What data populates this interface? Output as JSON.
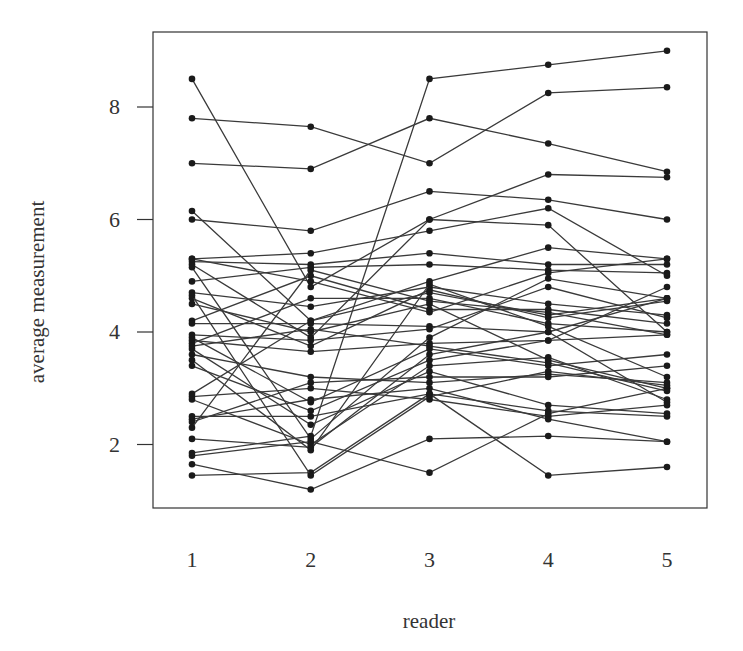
{
  "chart_data": {
    "type": "line",
    "title": "",
    "xlabel": "reader",
    "ylabel": "average measurement",
    "categories": [
      "1",
      "2",
      "3",
      "4",
      "5"
    ],
    "x": [
      1,
      2,
      3,
      4,
      5
    ],
    "yticks": [
      2,
      4,
      6,
      8
    ],
    "ylim": [
      1.0,
      9.3
    ],
    "xlim": [
      0.7,
      5.35
    ],
    "grid": false,
    "legend": "none",
    "x_ticks_drawn": false,
    "line_color": "#3a3a3a",
    "point_color": "#1a1a1a",
    "series": [
      {
        "name": "s1",
        "values": [
          8.5,
          4.8,
          6.0,
          5.9,
          4.0
        ]
      },
      {
        "name": "s2",
        "values": [
          7.8,
          7.65,
          7.0,
          8.25,
          8.35
        ]
      },
      {
        "name": "s3",
        "values": [
          7.0,
          6.9,
          7.8,
          7.35,
          6.85
        ]
      },
      {
        "name": "s4",
        "values": [
          6.15,
          4.2,
          4.9,
          5.5,
          5.3
        ]
      },
      {
        "name": "s5",
        "values": [
          6.0,
          5.8,
          6.5,
          6.35,
          6.0
        ]
      },
      {
        "name": "s6",
        "values": [
          5.3,
          5.4,
          5.8,
          6.2,
          5.0
        ]
      },
      {
        "name": "s7",
        "values": [
          5.25,
          5.2,
          5.4,
          5.2,
          5.2
        ]
      },
      {
        "name": "s8",
        "values": [
          5.2,
          3.9,
          6.0,
          6.8,
          6.75
        ]
      },
      {
        "name": "s9",
        "values": [
          5.15,
          2.1,
          3.9,
          4.95,
          4.6
        ]
      },
      {
        "name": "s10",
        "values": [
          4.9,
          5.15,
          5.2,
          5.1,
          5.05
        ]
      },
      {
        "name": "s11",
        "values": [
          4.7,
          4.45,
          4.8,
          4.5,
          4.3
        ]
      },
      {
        "name": "s12",
        "values": [
          4.6,
          3.75,
          4.75,
          4.25,
          4.55
        ]
      },
      {
        "name": "s13",
        "values": [
          4.5,
          4.0,
          4.5,
          3.5,
          3.0
        ]
      },
      {
        "name": "s14",
        "values": [
          4.2,
          5.0,
          4.4,
          4.4,
          4.15
        ]
      },
      {
        "name": "s15",
        "values": [
          4.15,
          4.15,
          4.1,
          4.0,
          4.6
        ]
      },
      {
        "name": "s16",
        "values": [
          3.9,
          2.75,
          3.7,
          3.4,
          3.6
        ]
      },
      {
        "name": "s17",
        "values": [
          3.85,
          3.65,
          3.8,
          3.85,
          3.95
        ]
      },
      {
        "name": "s18",
        "values": [
          3.8,
          4.6,
          4.6,
          4.15,
          4.0
        ]
      },
      {
        "name": "s19",
        "values": [
          3.7,
          2.35,
          3.3,
          2.7,
          2.55
        ]
      },
      {
        "name": "s20",
        "values": [
          3.6,
          3.2,
          3.1,
          3.25,
          3.1
        ]
      },
      {
        "name": "s21",
        "values": [
          3.5,
          1.9,
          4.85,
          4.1,
          3.2
        ]
      },
      {
        "name": "s22",
        "values": [
          3.4,
          2.6,
          3.5,
          3.85,
          4.8
        ]
      },
      {
        "name": "s23",
        "values": [
          2.9,
          4.2,
          4.7,
          4.3,
          4.6
        ]
      },
      {
        "name": "s24",
        "values": [
          2.85,
          3.0,
          2.8,
          2.5,
          2.7
        ]
      },
      {
        "name": "s25",
        "values": [
          2.8,
          2.0,
          3.4,
          3.55,
          2.8
        ]
      },
      {
        "name": "s26",
        "values": [
          2.5,
          2.5,
          2.9,
          2.6,
          2.5
        ]
      },
      {
        "name": "s27",
        "values": [
          2.4,
          3.1,
          3.2,
          3.2,
          3.4
        ]
      },
      {
        "name": "s28",
        "values": [
          2.3,
          5.1,
          4.55,
          4.35,
          3.95
        ]
      },
      {
        "name": "s29",
        "values": [
          2.1,
          1.95,
          3.6,
          4.0,
          2.75
        ]
      },
      {
        "name": "s30",
        "values": [
          1.85,
          2.15,
          8.5,
          8.75,
          9.0
        ]
      },
      {
        "name": "s31",
        "values": [
          1.8,
          2.05,
          1.5,
          2.55,
          3.0
        ]
      },
      {
        "name": "s32",
        "values": [
          1.65,
          1.2,
          2.1,
          2.15,
          2.05
        ]
      },
      {
        "name": "s33",
        "values": [
          1.45,
          1.5,
          2.9,
          1.45,
          1.6
        ]
      },
      {
        "name": "s34",
        "values": [
          5.3,
          4.9,
          4.35,
          5.05,
          5.3
        ]
      },
      {
        "name": "s35",
        "values": [
          3.75,
          4.05,
          3.75,
          3.45,
          2.95
        ]
      },
      {
        "name": "s36",
        "values": [
          2.45,
          2.8,
          3.0,
          2.45,
          2.05
        ]
      },
      {
        "name": "s37",
        "values": [
          4.65,
          1.45,
          2.85,
          3.3,
          3.05
        ]
      },
      {
        "name": "s38",
        "values": [
          3.95,
          3.85,
          4.05,
          4.8,
          4.25
        ]
      }
    ]
  },
  "axes": {
    "xlabel": "reader",
    "ylabel": "average measurement",
    "xtick_labels": [
      "1",
      "2",
      "3",
      "4",
      "5"
    ],
    "ytick_labels": [
      "2",
      "4",
      "6",
      "8"
    ]
  }
}
